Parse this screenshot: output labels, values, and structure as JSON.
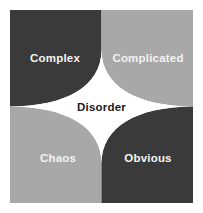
{
  "diagram": {
    "center": {
      "label": "Disorder",
      "text_color": "#1c1c1c",
      "fill_color": "#ffffff"
    },
    "quadrants": [
      {
        "id": "complex",
        "label": "Complex",
        "position": "top-left",
        "fill_color": "#3a3a3a",
        "text_color": "#f4f4f4"
      },
      {
        "id": "complicated",
        "label": "Complicated",
        "position": "top-right",
        "fill_color": "#a8a8a8",
        "text_color": "#f2f2f2"
      },
      {
        "id": "chaos",
        "label": "Chaos",
        "position": "bottom-left",
        "fill_color": "#a8a8a8",
        "text_color": "#f2f2f2"
      },
      {
        "id": "obvious",
        "label": "Obvious",
        "position": "bottom-right",
        "fill_color": "#3a3a3a",
        "text_color": "#f4f4f4"
      }
    ],
    "background_color": "#ffffff"
  }
}
